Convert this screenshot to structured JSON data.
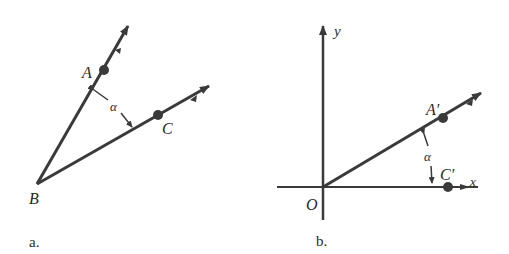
{
  "figure_a": {
    "caption": "a.",
    "vertex_label": "B",
    "point1_label": "A",
    "point2_label": "C",
    "angle_label": "α"
  },
  "figure_b": {
    "caption": "b.",
    "origin_label": "O",
    "y_axis_label": "y",
    "x_axis_label": "x",
    "point1_label": "A′",
    "point2_label": "C′",
    "angle_label": "α"
  },
  "colors": {
    "ink": "#3a3a3a"
  }
}
